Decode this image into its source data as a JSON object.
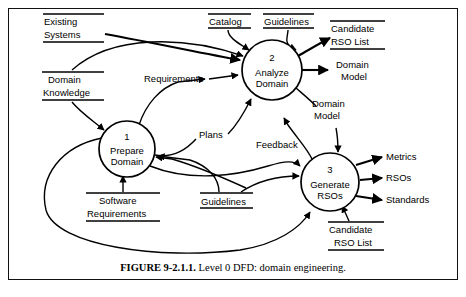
{
  "figure": {
    "number_label": "FIGURE 9-2.1.1.",
    "caption_text": "Level 0 DFD: domain engineering.",
    "title": "Level 0 DFD: domain engineering"
  },
  "diagram": {
    "type": "data-flow-diagram",
    "notation": "Yourdon/DeMarco",
    "processes": [
      {
        "id": "1",
        "number": "1",
        "name_line1": "Prepare",
        "name_line2": "Domain",
        "cx": 127,
        "cy": 149,
        "r": 28
      },
      {
        "id": "2",
        "number": "2",
        "name_line1": "Analyze",
        "name_line2": "Domain",
        "cx": 272,
        "cy": 70,
        "r": 30
      },
      {
        "id": "3",
        "number": "3",
        "name_line1": "Generate",
        "name_line2": "RSOs",
        "cx": 330,
        "cy": 182,
        "r": 29
      }
    ],
    "data_stores": [
      {
        "id": "existing-systems",
        "line1": "Existing",
        "line2": "Systems"
      },
      {
        "id": "catalog",
        "line1": "Catalog",
        "line2": ""
      },
      {
        "id": "guidelines-top",
        "line1": "Guidelines",
        "line2": ""
      },
      {
        "id": "candidate-rso-list-top",
        "line1": "Candidate",
        "line2": "RSO List"
      },
      {
        "id": "domain-knowledge",
        "line1": "Domain",
        "line2": "Knowledge"
      },
      {
        "id": "software-requirements",
        "line1": "Software",
        "line2": "Requirements"
      },
      {
        "id": "guidelines-bottom",
        "line1": "Guidelines",
        "line2": ""
      },
      {
        "id": "candidate-rso-list-bottom",
        "line1": "Candidate",
        "line2": "RSO List"
      }
    ],
    "data_flows": [
      {
        "id": "requirements",
        "label": "Requirements",
        "from": "1",
        "to": "2"
      },
      {
        "id": "plans",
        "label": "Plans",
        "from": "1",
        "to": "2"
      },
      {
        "id": "domain-model-out",
        "label_line1": "Domain",
        "label_line2": "Model",
        "from": "2",
        "to": "sink"
      },
      {
        "id": "domain-model-to-3",
        "label_line1": "Domain",
        "label_line2": "Model",
        "from": "2",
        "to": "3"
      },
      {
        "id": "feedback",
        "label": "Feedback",
        "from": "3",
        "to": "2"
      },
      {
        "id": "metrics",
        "label": "Metrics",
        "from": "3",
        "to": "sink"
      },
      {
        "id": "rsos",
        "label": "RSOs",
        "from": "3",
        "to": "sink"
      },
      {
        "id": "standards",
        "label": "Standards",
        "from": "3",
        "to": "sink"
      }
    ]
  },
  "labels": {
    "existing_systems_1": "Existing",
    "existing_systems_2": "Systems",
    "catalog": "Catalog",
    "guidelines_top": "Guidelines",
    "candidate_top_1": "Candidate",
    "candidate_top_2": "RSO List",
    "domain_knowledge_1": "Domain",
    "domain_knowledge_2": "Knowledge",
    "requirements": "Requirements",
    "plans": "Plans",
    "domain_model_right_1": "Domain",
    "domain_model_right_2": "Model",
    "domain_model_mid_1": "Domain",
    "domain_model_mid_2": "Model",
    "feedback": "Feedback",
    "metrics": "Metrics",
    "rsos": "RSOs",
    "standards": "Standards",
    "software_requirements_1": "Software",
    "software_requirements_2": "Requirements",
    "guidelines_bottom": "Guidelines",
    "candidate_bottom_1": "Candidate",
    "candidate_bottom_2": "RSO List",
    "proc1_num": "1",
    "proc1_n1": "Prepare",
    "proc1_n2": "Domain",
    "proc2_num": "2",
    "proc2_n1": "Analyze",
    "proc2_n2": "Domain",
    "proc3_num": "3",
    "proc3_n1": "Generate",
    "proc3_n2": "RSOs"
  },
  "colors": {
    "ink": "#000000",
    "paper": "#ffffff",
    "frame": "#111111"
  }
}
